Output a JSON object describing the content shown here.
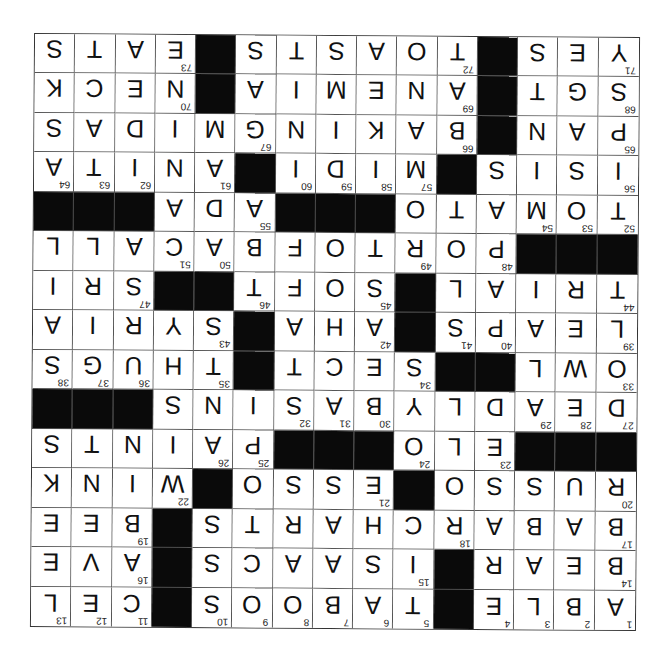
{
  "puzzle": {
    "size": 15,
    "orientation": "rotated-180",
    "colors": {
      "block": "#0a0a0a",
      "cell": "#ffffff",
      "line": "#555555",
      "text": "#111111"
    },
    "rows": [
      [
        {
          "l": "S"
        },
        {
          "l": "T"
        },
        {
          "l": "A"
        },
        {
          "l": "E",
          "n": "73"
        },
        {
          "b": 1
        },
        {
          "l": "S"
        },
        {
          "l": "T"
        },
        {
          "l": "S"
        },
        {
          "l": "A"
        },
        {
          "l": "O"
        },
        {
          "l": "T",
          "n": "72"
        },
        {
          "b": 1
        },
        {
          "l": "S"
        },
        {
          "l": "E"
        },
        {
          "l": "Y",
          "n": "71"
        }
      ],
      [
        {
          "l": "K"
        },
        {
          "l": "C"
        },
        {
          "l": "E"
        },
        {
          "l": "N",
          "n": "70"
        },
        {
          "b": 1
        },
        {
          "l": "A"
        },
        {
          "l": "I"
        },
        {
          "l": "M"
        },
        {
          "l": "E"
        },
        {
          "l": "N"
        },
        {
          "l": "A",
          "n": "69"
        },
        {
          "b": 1
        },
        {
          "l": "T"
        },
        {
          "l": "G"
        },
        {
          "l": "S",
          "n": "68"
        }
      ],
      [
        {
          "l": "S"
        },
        {
          "l": "A"
        },
        {
          "l": "D"
        },
        {
          "l": "I"
        },
        {
          "l": "M"
        },
        {
          "l": "G",
          "n": "67"
        },
        {
          "l": "N"
        },
        {
          "l": "I"
        },
        {
          "l": "K"
        },
        {
          "l": "A"
        },
        {
          "l": "B",
          "n": "66"
        },
        {
          "b": 1
        },
        {
          "l": "N"
        },
        {
          "l": "A"
        },
        {
          "l": "P",
          "n": "65"
        }
      ],
      [
        {
          "l": "A",
          "n": "64"
        },
        {
          "l": "T",
          "n": "63"
        },
        {
          "l": "I",
          "n": "62"
        },
        {
          "l": "N"
        },
        {
          "l": "A",
          "n": "61"
        },
        {
          "b": 1
        },
        {
          "l": "I",
          "n": "60"
        },
        {
          "l": "D",
          "n": "59"
        },
        {
          "l": "I",
          "n": "58"
        },
        {
          "l": "M",
          "n": "57"
        },
        {
          "b": 1
        },
        {
          "l": "S"
        },
        {
          "l": "I"
        },
        {
          "l": "S"
        },
        {
          "l": "I",
          "n": "56"
        }
      ],
      [
        {
          "b": 1
        },
        {
          "b": 1
        },
        {
          "b": 1
        },
        {
          "l": "A"
        },
        {
          "l": "D"
        },
        {
          "l": "A",
          "n": "55"
        },
        {
          "b": 1
        },
        {
          "b": 1
        },
        {
          "b": 1
        },
        {
          "l": "O"
        },
        {
          "l": "T"
        },
        {
          "l": "A"
        },
        {
          "l": "M",
          "n": "54"
        },
        {
          "l": "O",
          "n": "53"
        },
        {
          "l": "T",
          "n": "52"
        }
      ],
      [
        {
          "l": "L"
        },
        {
          "l": "L"
        },
        {
          "l": "A"
        },
        {
          "l": "C",
          "n": "51"
        },
        {
          "l": "A",
          "n": "50"
        },
        {
          "l": "B"
        },
        {
          "l": "F"
        },
        {
          "l": "O"
        },
        {
          "l": "T"
        },
        {
          "l": "R",
          "n": "49"
        },
        {
          "l": "O"
        },
        {
          "l": "P",
          "n": "48"
        },
        {
          "b": 1
        },
        {
          "b": 1
        },
        {
          "b": 1
        }
      ],
      [
        {
          "l": "I"
        },
        {
          "l": "R"
        },
        {
          "l": "S",
          "n": "47"
        },
        {
          "b": 1
        },
        {
          "b": 1
        },
        {
          "l": "T",
          "n": "46"
        },
        {
          "l": "F"
        },
        {
          "l": "O"
        },
        {
          "l": "S",
          "n": "45"
        },
        {
          "b": 1
        },
        {
          "l": "L"
        },
        {
          "l": "A"
        },
        {
          "l": "I"
        },
        {
          "l": "R"
        },
        {
          "l": "T",
          "n": "44"
        }
      ],
      [
        {
          "l": "A"
        },
        {
          "l": "I"
        },
        {
          "l": "R"
        },
        {
          "l": "Y"
        },
        {
          "l": "S",
          "n": "43"
        },
        {
          "b": 1
        },
        {
          "l": "A"
        },
        {
          "l": "H"
        },
        {
          "l": "A",
          "n": "42"
        },
        {
          "b": 1
        },
        {
          "l": "S",
          "n": "41"
        },
        {
          "l": "P",
          "n": "40"
        },
        {
          "l": "A"
        },
        {
          "l": "E"
        },
        {
          "l": "L",
          "n": "39"
        }
      ],
      [
        {
          "l": "S",
          "n": "38"
        },
        {
          "l": "G",
          "n": "37"
        },
        {
          "l": "U",
          "n": "36"
        },
        {
          "l": "H"
        },
        {
          "l": "T",
          "n": "35"
        },
        {
          "b": 1
        },
        {
          "l": "T"
        },
        {
          "l": "C"
        },
        {
          "l": "E"
        },
        {
          "l": "S",
          "n": "34"
        },
        {
          "b": 1
        },
        {
          "b": 1
        },
        {
          "l": "L"
        },
        {
          "l": "W"
        },
        {
          "l": "O",
          "n": "33"
        }
      ],
      [
        {
          "b": 1
        },
        {
          "b": 1
        },
        {
          "b": 1
        },
        {
          "l": "S"
        },
        {
          "l": "N"
        },
        {
          "l": "I"
        },
        {
          "l": "S",
          "n": "32"
        },
        {
          "l": "A",
          "n": "31"
        },
        {
          "l": "B",
          "n": "30"
        },
        {
          "l": "Y"
        },
        {
          "l": "L"
        },
        {
          "l": "D"
        },
        {
          "l": "A",
          "n": "29"
        },
        {
          "l": "E",
          "n": "28"
        },
        {
          "l": "D",
          "n": "27"
        }
      ],
      [
        {
          "l": "S"
        },
        {
          "l": "T"
        },
        {
          "l": "N"
        },
        {
          "l": "I"
        },
        {
          "l": "A",
          "n": "26"
        },
        {
          "l": "P",
          "n": "25"
        },
        {
          "b": 1
        },
        {
          "b": 1
        },
        {
          "b": 1
        },
        {
          "l": "O",
          "n": "24"
        },
        {
          "l": "L"
        },
        {
          "l": "E",
          "n": "23"
        },
        {
          "b": 1
        },
        {
          "b": 1
        },
        {
          "b": 1
        }
      ],
      [
        {
          "l": "K"
        },
        {
          "l": "N"
        },
        {
          "l": "I"
        },
        {
          "l": "W",
          "n": "22"
        },
        {
          "b": 1
        },
        {
          "l": "O"
        },
        {
          "l": "S"
        },
        {
          "l": "S"
        },
        {
          "l": "E",
          "n": "21"
        },
        {
          "b": 1
        },
        {
          "l": "O"
        },
        {
          "l": "S"
        },
        {
          "l": "S"
        },
        {
          "l": "U"
        },
        {
          "l": "R",
          "n": "20"
        }
      ],
      [
        {
          "l": "E"
        },
        {
          "l": "E"
        },
        {
          "l": "B",
          "n": "19"
        },
        {
          "b": 1
        },
        {
          "l": "S"
        },
        {
          "l": "T"
        },
        {
          "l": "R"
        },
        {
          "l": "A"
        },
        {
          "l": "H"
        },
        {
          "l": "C"
        },
        {
          "l": "R",
          "n": "18"
        },
        {
          "l": "A"
        },
        {
          "l": "B"
        },
        {
          "l": "A"
        },
        {
          "l": "B",
          "n": "17"
        }
      ],
      [
        {
          "l": "E"
        },
        {
          "l": "V"
        },
        {
          "l": "A",
          "n": "16"
        },
        {
          "b": 1
        },
        {
          "l": "S"
        },
        {
          "l": "C"
        },
        {
          "l": "A"
        },
        {
          "l": "A"
        },
        {
          "l": "S"
        },
        {
          "l": "I",
          "n": "15"
        },
        {
          "b": 1
        },
        {
          "l": "R"
        },
        {
          "l": "A"
        },
        {
          "l": "E"
        },
        {
          "l": "B",
          "n": "14"
        }
      ],
      [
        {
          "l": "L",
          "n": "13"
        },
        {
          "l": "E",
          "n": "12"
        },
        {
          "l": "C",
          "n": "11"
        },
        {
          "b": 1
        },
        {
          "l": "S",
          "n": "10"
        },
        {
          "l": "O",
          "n": "9"
        },
        {
          "l": "O",
          "n": "8"
        },
        {
          "l": "B",
          "n": "7"
        },
        {
          "l": "A",
          "n": "6"
        },
        {
          "l": "T",
          "n": "5"
        },
        {
          "b": 1
        },
        {
          "l": "E",
          "n": "4"
        },
        {
          "l": "L",
          "n": "3"
        },
        {
          "l": "B",
          "n": "2"
        },
        {
          "l": "A",
          "n": "1"
        }
      ]
    ]
  }
}
